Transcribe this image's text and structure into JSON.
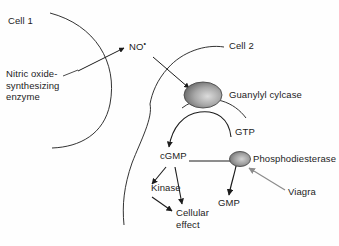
{
  "diagram": {
    "background_color": "#fefefe",
    "stroke_color": "#1c1c1c",
    "inhibitor_arrow_color": "#8c8c8c",
    "labels": {
      "cell1": "Cell 1",
      "cell2": "Cell 2",
      "enzyme": "Nitric oxide-\nsynthesizing\nenzyme",
      "no_radical": "NO",
      "no_radical_superscript": "•",
      "guanylyl_cyclase": "Guanylyl cylcase",
      "gtp": "GTP",
      "cgmp": "cGMP",
      "phosphodiesterase": "Phosphodiesterase",
      "viagra": "Viagra",
      "gmp": "GMP",
      "kinase": "Kinase",
      "cellular_effect": "Cellular\neffect"
    },
    "nodes": [
      {
        "name": "nitric-oxide-synthesizing-enzyme",
        "kind": "text-label",
        "compartment": "Cell 1"
      },
      {
        "name": "no-radical",
        "kind": "molecule",
        "compartment": "extracellular"
      },
      {
        "name": "guanylyl-cyclase",
        "kind": "membrane-enzyme",
        "compartment": "Cell 2 membrane",
        "shape": "ellipse"
      },
      {
        "name": "gtp",
        "kind": "molecule",
        "compartment": "Cell 2"
      },
      {
        "name": "cgmp",
        "kind": "molecule",
        "compartment": "Cell 2"
      },
      {
        "name": "phosphodiesterase",
        "kind": "enzyme",
        "compartment": "Cell 2",
        "shape": "ellipse"
      },
      {
        "name": "viagra",
        "kind": "drug",
        "compartment": "Cell 2"
      },
      {
        "name": "gmp",
        "kind": "molecule",
        "compartment": "Cell 2"
      },
      {
        "name": "kinase",
        "kind": "protein",
        "compartment": "Cell 2"
      },
      {
        "name": "cellular-effect",
        "kind": "outcome",
        "compartment": "Cell 2"
      }
    ],
    "edges": [
      {
        "from": "nitric-oxide-synthesizing-enzyme",
        "to": "no-radical",
        "type": "arrow"
      },
      {
        "from": "no-radical",
        "to": "guanylyl-cyclase",
        "type": "arrow"
      },
      {
        "from": "gtp",
        "to": "cgmp",
        "type": "arrow"
      },
      {
        "from": "cgmp",
        "to": "kinase",
        "type": "arrow"
      },
      {
        "from": "cgmp",
        "to": "cellular-effect",
        "type": "arrow"
      },
      {
        "from": "kinase",
        "to": "cellular-effect",
        "type": "arrow"
      },
      {
        "from": "cgmp",
        "to": "gmp",
        "type": "arrow"
      },
      {
        "from": "viagra",
        "to": "phosphodiesterase",
        "type": "inhibition-arrow"
      }
    ]
  }
}
